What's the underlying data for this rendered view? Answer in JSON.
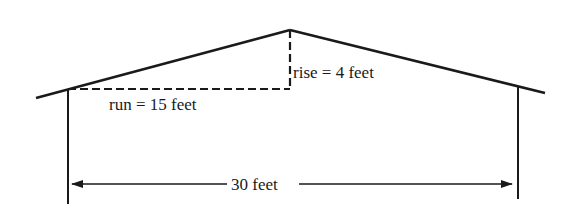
{
  "diagram": {
    "labels": {
      "run": "run = 15 feet",
      "rise": "rise = 4 feet",
      "span": "30 feet"
    },
    "values": {
      "run_feet": 15,
      "rise_feet": 4,
      "span_feet": 30
    },
    "colors": {
      "line": "#1a1a1a",
      "background": "#ffffff"
    }
  }
}
